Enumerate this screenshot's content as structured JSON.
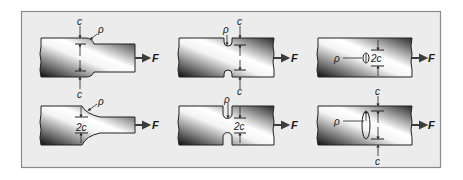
{
  "figure": {
    "frame": {
      "background": "#ececec",
      "border": "#8a8a8a"
    },
    "colors": {
      "bar_dark": "#111111",
      "bar_light": "#ffffff",
      "outline": "#222222",
      "arrow": "#3c3c3c"
    },
    "panels": [
      {
        "id": "shoulder-half-width",
        "row": 1,
        "col": 1,
        "labels": {
          "top_c": "c",
          "bottom_c": "c",
          "rho": "ρ",
          "force": "F"
        }
      },
      {
        "id": "shoulder-full-width",
        "row": 2,
        "col": 1,
        "labels": {
          "width": "2c",
          "rho": "ρ",
          "force": "F"
        }
      },
      {
        "id": "notch-half-width",
        "row": 1,
        "col": 2,
        "labels": {
          "top_c": "c",
          "rho": "ρ",
          "force": "F"
        }
      },
      {
        "id": "notch-full-width",
        "row": 2,
        "col": 2,
        "labels": {
          "top_c": "c",
          "width": "2c",
          "rho": "ρ",
          "force": "F"
        }
      },
      {
        "id": "hole-small",
        "row": 1,
        "col": 3,
        "labels": {
          "width": "2c",
          "rho": "ρ",
          "force": "F"
        }
      },
      {
        "id": "hole-large",
        "row": 2,
        "col": 3,
        "labels": {
          "top_c": "c",
          "bottom_c": "c",
          "rho": "ρ",
          "force": "F"
        }
      }
    ]
  }
}
